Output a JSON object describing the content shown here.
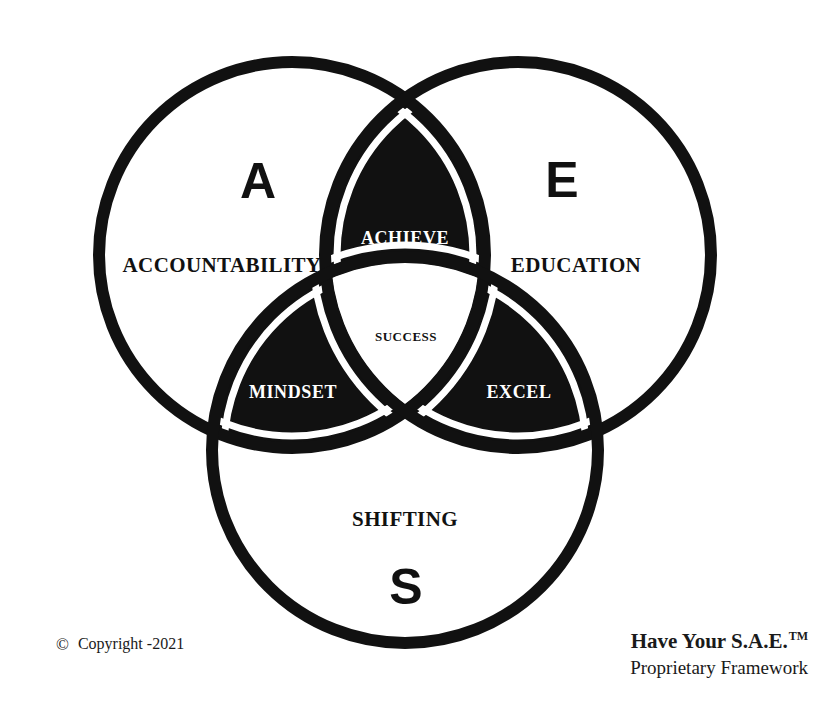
{
  "diagram": {
    "type": "venn-3-circle",
    "background_color": "#ffffff",
    "stroke_color": "#111111",
    "fill_color": "#111111",
    "halo_color": "#ffffff"
  },
  "circles": [
    {
      "id": "accountability",
      "letter": "A",
      "word": "ACCOUNTABILITY",
      "cx": 292,
      "cy": 255,
      "r": 193,
      "letter_x": 258,
      "letter_y": 185,
      "word_x": 222,
      "word_y": 267
    },
    {
      "id": "education",
      "letter": "E",
      "word": "EDUCATION",
      "cx": 518,
      "cy": 255,
      "r": 193,
      "letter_x": 562,
      "letter_y": 184,
      "word_x": 576,
      "word_y": 267
    },
    {
      "id": "shifting",
      "letter": "S",
      "word": "SHIFTING",
      "cx": 405,
      "cy": 450,
      "r": 193,
      "letter_x": 406,
      "letter_y": 591,
      "word_x": 405,
      "word_y": 521
    }
  ],
  "intersections": [
    {
      "id": "achieve",
      "label": "ACHIEVE",
      "between": [
        "accountability",
        "education"
      ],
      "label_x": 405,
      "label_y": 240,
      "fill": "#111111",
      "text_color": "#ffffff"
    },
    {
      "id": "mindset",
      "label": "MINDSET",
      "between": [
        "accountability",
        "shifting"
      ],
      "label_x": 293,
      "label_y": 394,
      "fill": "#111111",
      "text_color": "#ffffff"
    },
    {
      "id": "excel",
      "label": "EXCEL",
      "between": [
        "education",
        "shifting"
      ],
      "label_x": 519,
      "label_y": 394,
      "fill": "#111111",
      "text_color": "#ffffff"
    },
    {
      "id": "success",
      "label": "SUCCESS",
      "between": [
        "accountability",
        "education",
        "shifting"
      ],
      "label_x": 406,
      "label_y": 338,
      "fill": "#ffffff",
      "text_color": "#111111"
    }
  ],
  "footer": {
    "copyright_symbol": "©",
    "copyright_text": "Copyright -2021",
    "brand_name": "Have Your S.A.E.",
    "brand_tm": "TM",
    "brand_subtitle": "Proprietary Framework"
  }
}
